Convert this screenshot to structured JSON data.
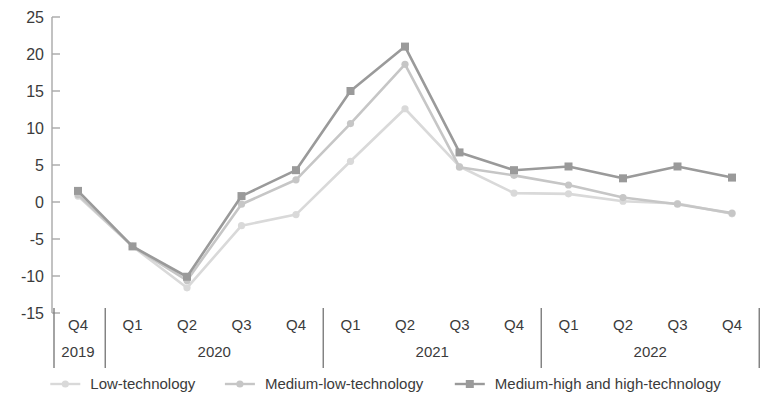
{
  "chart_data": {
    "type": "line",
    "title": "",
    "xlabel": "",
    "ylabel": "",
    "ylim": [
      -15,
      25
    ],
    "yticks": [
      25,
      20,
      15,
      10,
      5,
      0,
      -5,
      -10,
      -15
    ],
    "ytick_labels": [
      "25",
      "20",
      "15",
      "10",
      "5",
      "0",
      "-5",
      "-10",
      "-15"
    ],
    "grid": false,
    "legend_position": "bottom",
    "categories": [
      "Q4",
      "Q1",
      "Q2",
      "Q3",
      "Q4",
      "Q1",
      "Q2",
      "Q3",
      "Q4",
      "Q1",
      "Q2",
      "Q3",
      "Q4"
    ],
    "year_groups": [
      {
        "label": "2019",
        "quarters": [
          "Q4"
        ]
      },
      {
        "label": "2020",
        "quarters": [
          "Q1",
          "Q2",
          "Q3",
          "Q4"
        ]
      },
      {
        "label": "2021",
        "quarters": [
          "Q1",
          "Q2",
          "Q3",
          "Q4"
        ]
      },
      {
        "label": "2022",
        "quarters": [
          "Q1",
          "Q2",
          "Q3",
          "Q4"
        ]
      }
    ],
    "series": [
      {
        "name": "Low-technology",
        "color": "#d9d9d9",
        "marker": "circle",
        "values": [
          0.8,
          -6.0,
          -11.6,
          -3.2,
          -1.7,
          5.5,
          12.6,
          4.8,
          1.2,
          1.1,
          0.1,
          -0.2,
          -1.6
        ]
      },
      {
        "name": "Medium-low-technology",
        "color": "#c6c6c6",
        "marker": "circle",
        "values": [
          1.0,
          -6.0,
          -10.6,
          -0.3,
          3.0,
          10.6,
          18.6,
          4.7,
          3.6,
          2.3,
          0.6,
          -0.3,
          -1.5
        ]
      },
      {
        "name": "Medium-high and high-technology",
        "color": "#9a9a9a",
        "marker": "square",
        "values": [
          1.5,
          -6.0,
          -10.1,
          0.8,
          4.3,
          15.0,
          21.0,
          6.7,
          4.3,
          4.8,
          3.2,
          4.8,
          3.3
        ]
      }
    ]
  },
  "legend": {
    "items": [
      {
        "label": "Low-technology",
        "color": "#d9d9d9",
        "marker": "circle"
      },
      {
        "label": "Medium-low-technology",
        "color": "#c6c6c6",
        "marker": "circle"
      },
      {
        "label": "Medium-high and high-technology",
        "color": "#9a9a9a",
        "marker": "square"
      }
    ]
  },
  "axis": {
    "line_color": "#a8a8a8",
    "separator_color": "#7d7d7d",
    "text_color": "#3b3b3b"
  }
}
